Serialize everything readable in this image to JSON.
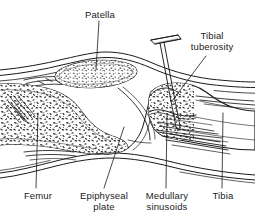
{
  "figure": {
    "style": "black-and-white line drawing",
    "ink_color": "#1b1b1b",
    "background_color": "#ffffff"
  },
  "labels": [
    {
      "id": "patella",
      "text": "Patella",
      "x": 78,
      "y": 10,
      "width": 44,
      "align": "center",
      "leader": {
        "x1": 99,
        "y1": 21,
        "x2": 96,
        "y2": 70
      }
    },
    {
      "id": "tibial-tuberosity",
      "text": "Tibial\ntuberosity",
      "x": 179,
      "y": 31,
      "width": 66,
      "align": "center",
      "leader": {
        "x1": 206,
        "y1": 56,
        "x2": 172,
        "y2": 101
      }
    },
    {
      "id": "femur",
      "text": "Femur",
      "x": 16,
      "y": 191,
      "width": 44,
      "align": "center",
      "leader": {
        "x1": 38,
        "y1": 113,
        "x2": 36,
        "y2": 188
      }
    },
    {
      "id": "epiphyseal-plate",
      "text": "Epiphyseal\nplate",
      "x": 73,
      "y": 191,
      "width": 62,
      "align": "center",
      "leader": {
        "x1": 124,
        "y1": 127,
        "x2": 104,
        "y2": 188
      }
    },
    {
      "id": "medullary-sinusoids",
      "text": "Medullary\nsinusoids",
      "x": 137,
      "y": 191,
      "width": 60,
      "align": "center",
      "leader": {
        "x1": 167,
        "y1": 114,
        "x2": 166,
        "y2": 188
      }
    },
    {
      "id": "tibia",
      "text": "Tibia",
      "x": 203,
      "y": 191,
      "width": 40,
      "align": "center",
      "leader": {
        "x1": 223,
        "y1": 113,
        "x2": 222,
        "y2": 188
      }
    }
  ],
  "anatomy": {
    "parts": [
      {
        "id": "skin-upper",
        "name": "upper skin and soft-tissue contour"
      },
      {
        "id": "skin-lower",
        "name": "lower skin and soft-tissue contour"
      },
      {
        "id": "patella-bone",
        "name": "patella with trabecular bone"
      },
      {
        "id": "femur-bone",
        "name": "distal femur with trabecular marrow"
      },
      {
        "id": "tibia-bone",
        "name": "proximal tibia with tibial tuberosity"
      },
      {
        "id": "epiphyseal-plate-line",
        "name": "epiphyseal growth plate"
      },
      {
        "id": "medullary-sinusoids-area",
        "name": "medullary sinusoids in tibial marrow"
      },
      {
        "id": "io-needle",
        "name": "intraosseous needle with flanged hub"
      },
      {
        "id": "patellar-tendon",
        "name": "patellar tendon / joint soft tissue"
      }
    ]
  }
}
